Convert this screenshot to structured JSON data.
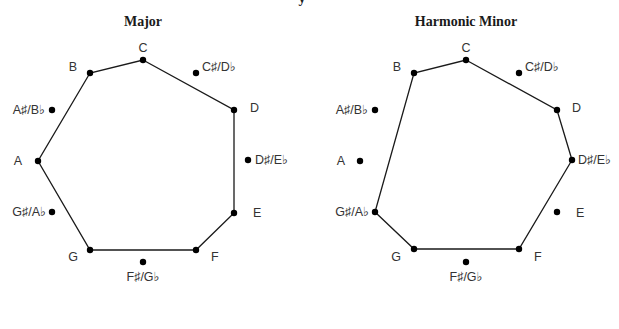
{
  "top_fragment": "y",
  "diagrams": [
    {
      "title": "Major",
      "title_pos": [
        143,
        26
      ],
      "notes": [
        {
          "name": "C",
          "x": 143,
          "y": 60,
          "lx": 143,
          "ly": 52,
          "anchor": "middle"
        },
        {
          "name": "C♯/D♭",
          "x": 196,
          "y": 73,
          "lx": 202,
          "ly": 71,
          "anchor": "start"
        },
        {
          "name": "D",
          "x": 234,
          "y": 110,
          "lx": 250,
          "ly": 112,
          "anchor": "start"
        },
        {
          "name": "D♯/E♭",
          "x": 248,
          "y": 160,
          "lx": 255,
          "ly": 164,
          "anchor": "start"
        },
        {
          "name": "E",
          "x": 234,
          "y": 213,
          "lx": 253,
          "ly": 217,
          "anchor": "start"
        },
        {
          "name": "F",
          "x": 196,
          "y": 250,
          "lx": 211,
          "ly": 261,
          "anchor": "start"
        },
        {
          "name": "F♯/G♭",
          "x": 143,
          "y": 262,
          "lx": 143,
          "ly": 281,
          "anchor": "middle"
        },
        {
          "name": "G",
          "x": 90,
          "y": 250,
          "lx": 78,
          "ly": 261,
          "anchor": "end"
        },
        {
          "name": "G♯/A♭",
          "x": 52,
          "y": 212,
          "lx": 46,
          "ly": 216,
          "anchor": "end"
        },
        {
          "name": "A",
          "x": 38,
          "y": 161,
          "lx": 22,
          "ly": 165,
          "anchor": "end"
        },
        {
          "name": "A♯/B♭",
          "x": 52,
          "y": 110,
          "lx": 45,
          "ly": 114,
          "anchor": "end"
        },
        {
          "name": "B",
          "x": 90,
          "y": 73,
          "lx": 77,
          "ly": 71,
          "anchor": "end"
        }
      ],
      "scale_path": [
        "C",
        "D",
        "E",
        "F",
        "G",
        "A",
        "B"
      ]
    },
    {
      "title": "Harmonic Minor",
      "title_pos": [
        466,
        26
      ],
      "notes": [
        {
          "name": "C",
          "x": 466,
          "y": 60,
          "lx": 466,
          "ly": 52,
          "anchor": "middle"
        },
        {
          "name": "C♯/D♭",
          "x": 519,
          "y": 73,
          "lx": 525,
          "ly": 71,
          "anchor": "start"
        },
        {
          "name": "D",
          "x": 557,
          "y": 110,
          "lx": 572,
          "ly": 112,
          "anchor": "start"
        },
        {
          "name": "D♯/E♭",
          "x": 572,
          "y": 160,
          "lx": 578,
          "ly": 164,
          "anchor": "start"
        },
        {
          "name": "E",
          "x": 557,
          "y": 212,
          "lx": 576,
          "ly": 217,
          "anchor": "start"
        },
        {
          "name": "F",
          "x": 519,
          "y": 249,
          "lx": 534,
          "ly": 261,
          "anchor": "start"
        },
        {
          "name": "F♯/G♭",
          "x": 466,
          "y": 262,
          "lx": 466,
          "ly": 281,
          "anchor": "middle"
        },
        {
          "name": "G",
          "x": 414,
          "y": 249,
          "lx": 401,
          "ly": 261,
          "anchor": "end"
        },
        {
          "name": "G♯/A♭",
          "x": 375,
          "y": 212,
          "lx": 369,
          "ly": 216,
          "anchor": "end"
        },
        {
          "name": "A",
          "x": 360,
          "y": 161,
          "lx": 345,
          "ly": 165,
          "anchor": "end"
        },
        {
          "name": "A♯/B♭",
          "x": 375,
          "y": 110,
          "lx": 368,
          "ly": 114,
          "anchor": "end"
        },
        {
          "name": "B",
          "x": 414,
          "y": 73,
          "lx": 401,
          "ly": 71,
          "anchor": "end"
        }
      ],
      "scale_path": [
        "C",
        "D",
        "D♯/E♭",
        "F",
        "G",
        "G♯/A♭",
        "B"
      ]
    }
  ]
}
